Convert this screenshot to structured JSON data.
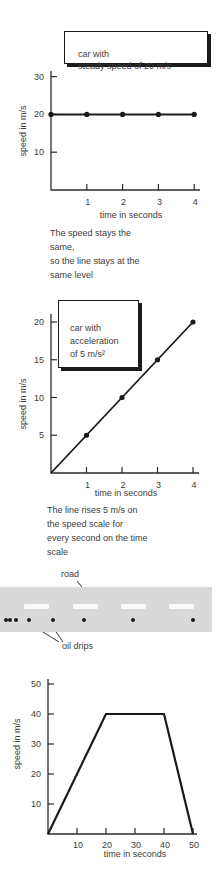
{
  "page": {
    "background": "#ffffff",
    "text_color": "#3d3d3d",
    "line_color": "#1b1b1b",
    "axis_color": "#2b2b2b"
  },
  "figure1": {
    "box_label": "car with\nsteady speed of 20 m/s",
    "caption": "The speed stays the\nsame,\nso the line stays at the\nsame level"
  },
  "figure2": {
    "box_label": "car with\nacceleration\nof 5 m/s²",
    "caption": "The line rises 5 m/s on\nthe speed scale for\nevery second on the time\nscale"
  },
  "road_figure": {
    "road_label": "road",
    "oil_drips_label": "oil drips",
    "band_color": "#d9d9d9",
    "dash_color": "#fbfbfb",
    "dot_color": "#1b1b1b",
    "lane_dash_xs": [
      24,
      73,
      121,
      169
    ],
    "lane_dash_width": 25,
    "oil_drip_xs": [
      6,
      10,
      16,
      29,
      53,
      84,
      133,
      193
    ]
  },
  "chart_data": [
    {
      "type": "line",
      "title": "car with steady speed of 20 m/s",
      "x": [
        0,
        1,
        2,
        3,
        4
      ],
      "series": [
        {
          "name": "speed",
          "values": [
            20,
            20,
            20,
            20,
            20
          ]
        }
      ],
      "points": [
        [
          0,
          20
        ],
        [
          1,
          20
        ],
        [
          2,
          20
        ],
        [
          3,
          20
        ],
        [
          4,
          20
        ]
      ],
      "xlabel": "time in seconds",
      "ylabel": "speed in m/s",
      "xticks": [
        1,
        2,
        3,
        4
      ],
      "yticks": [
        10,
        20,
        30
      ],
      "xlim": [
        0,
        4.2
      ],
      "ylim": [
        0,
        31.5
      ],
      "grid": false,
      "legend": "none"
    },
    {
      "type": "line",
      "title": "car with acceleration of 5 m/s²",
      "x": [
        0,
        1,
        2,
        3,
        4
      ],
      "series": [
        {
          "name": "speed",
          "values": [
            0,
            5,
            10,
            15,
            20
          ]
        }
      ],
      "points": [
        [
          1,
          5
        ],
        [
          2,
          10
        ],
        [
          3,
          15
        ],
        [
          4,
          20
        ]
      ],
      "xlabel": "time in seconds",
      "ylabel": "speed in m/s",
      "xticks": [
        1,
        2,
        3,
        4
      ],
      "yticks": [
        5,
        10,
        15,
        20
      ],
      "xlim": [
        0,
        4.2
      ],
      "ylim": [
        0,
        21
      ],
      "grid": false,
      "legend": "none"
    },
    {
      "type": "line",
      "title": "",
      "x": [
        0,
        20,
        40,
        50
      ],
      "series": [
        {
          "name": "speed",
          "values": [
            0,
            40,
            40,
            0
          ]
        }
      ],
      "points": [],
      "xlabel": "time in seconds",
      "ylabel": "speed in m/s",
      "xticks": [
        10,
        20,
        30,
        40,
        50
      ],
      "yticks": [
        10,
        20,
        30,
        40,
        50
      ],
      "xlim": [
        0,
        51
      ],
      "ylim": [
        0,
        52
      ],
      "grid": false,
      "legend": "none"
    }
  ]
}
